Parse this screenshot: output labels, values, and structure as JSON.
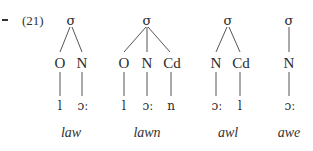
{
  "example": {
    "bullet": "-",
    "number": "(21)"
  },
  "trees": [
    {
      "root": "σ",
      "constituents": [
        "O",
        "N"
      ],
      "segments": [
        "l",
        "ɔː"
      ],
      "gloss": "law"
    },
    {
      "root": "σ",
      "constituents": [
        "O",
        "N",
        "Cd"
      ],
      "segments": [
        "l",
        "ɔː",
        "n"
      ],
      "gloss": "lawn"
    },
    {
      "root": "σ",
      "constituents": [
        "N",
        "Cd"
      ],
      "segments": [
        "ɔː",
        "l"
      ],
      "gloss": "awl"
    },
    {
      "root": "σ",
      "constituents": [
        "N"
      ],
      "segments": [
        "ɔː"
      ],
      "gloss": "awe"
    }
  ]
}
